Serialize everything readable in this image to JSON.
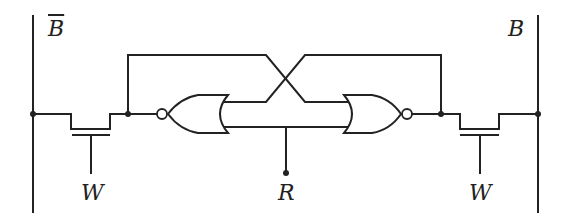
{
  "diagram": {
    "type": "SRAM cell (cross-coupled NOR latch with access transistors)",
    "labels": {
      "bitline_bar": "B",
      "bitline": "B",
      "word_left": "W",
      "word_right": "W",
      "reset": "R"
    },
    "components": [
      {
        "id": "bitline-left",
        "kind": "bitline",
        "label": "B̄"
      },
      {
        "id": "bitline-right",
        "kind": "bitline",
        "label": "B"
      },
      {
        "id": "access-transistor-left",
        "kind": "nmos",
        "gate": "W"
      },
      {
        "id": "access-transistor-right",
        "kind": "nmos",
        "gate": "W"
      },
      {
        "id": "nor-gate-left",
        "kind": "NOR",
        "direction": "left"
      },
      {
        "id": "nor-gate-right",
        "kind": "NOR",
        "direction": "right"
      },
      {
        "id": "reset-line",
        "kind": "input",
        "label": "R"
      }
    ],
    "colors": {
      "line": "#222222",
      "background": "#ffffff"
    }
  }
}
